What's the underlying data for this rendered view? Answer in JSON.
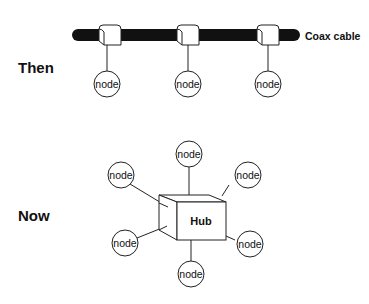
{
  "diagram": {
    "then": {
      "label": "Then",
      "cable_label": "Coax cable",
      "nodes": [
        "node",
        "node",
        "node"
      ]
    },
    "now": {
      "label": "Now",
      "hub_label": "Hub",
      "nodes": [
        "node",
        "node",
        "node",
        "node",
        "node",
        "node"
      ]
    },
    "colors": {
      "cable": "#111111",
      "stroke": "#222222",
      "background": "#ffffff"
    }
  }
}
